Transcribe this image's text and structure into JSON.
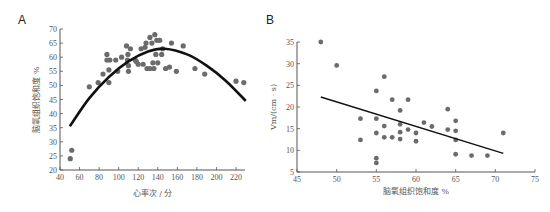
{
  "chart_data": [
    {
      "panel": "A",
      "type": "scatter",
      "title": "",
      "xlabel": "心率次 / 分",
      "ylabel": "脑氧组织饱和度 %",
      "xlim": [
        40,
        230
      ],
      "ylim": [
        20,
        70
      ],
      "xticks": [
        40,
        60,
        80,
        100,
        120,
        140,
        160,
        180,
        200,
        220
      ],
      "yticks": [
        20,
        25,
        30,
        35,
        40,
        45,
        50,
        55,
        60,
        65,
        70
      ],
      "grid": false,
      "points": [
        [
          50.5,
          24
        ],
        [
          52,
          27
        ],
        [
          70,
          49.5
        ],
        [
          79,
          51
        ],
        [
          84,
          54
        ],
        [
          88,
          61
        ],
        [
          88,
          59
        ],
        [
          91,
          59
        ],
        [
          90,
          51
        ],
        [
          90,
          55.5
        ],
        [
          97,
          59
        ],
        [
          99,
          55
        ],
        [
          103,
          60
        ],
        [
          108,
          64
        ],
        [
          109.5,
          61
        ],
        [
          110,
          57
        ],
        [
          110,
          55
        ],
        [
          112,
          63
        ],
        [
          109,
          59
        ],
        [
          117,
          59
        ],
        [
          118,
          58.5
        ],
        [
          120,
          57.5
        ],
        [
          123,
          63
        ],
        [
          125,
          57.5
        ],
        [
          127,
          63.5
        ],
        [
          128,
          65
        ],
        [
          129,
          56
        ],
        [
          132,
          56
        ],
        [
          132,
          67
        ],
        [
          134,
          65
        ],
        [
          135,
          58
        ],
        [
          136,
          56
        ],
        [
          137,
          68
        ],
        [
          138,
          61
        ],
        [
          139,
          66
        ],
        [
          140,
          58
        ],
        [
          142,
          66
        ],
        [
          144,
          61
        ],
        [
          145,
          63
        ],
        [
          148,
          56
        ],
        [
          152,
          56.5
        ],
        [
          154,
          65
        ],
        [
          159,
          55
        ],
        [
          166,
          64
        ],
        [
          178,
          56
        ],
        [
          188,
          54
        ],
        [
          220,
          51.5
        ],
        [
          228,
          51
        ]
      ],
      "fit": {
        "type": "quadratic",
        "x": [
          50,
          70,
          90,
          110,
          130,
          147,
          170,
          190,
          210,
          230
        ],
        "y": [
          35.5,
          45.5,
          53,
          58.5,
          62,
          63,
          61,
          57,
          51.5,
          44.5
        ]
      }
    },
    {
      "panel": "B",
      "type": "scatter",
      "title": "",
      "xlabel": "脑氧组织饱和度 %",
      "ylabel": "Vm/(cm · s)",
      "xlim": [
        45,
        75
      ],
      "ylim": [
        5,
        35
      ],
      "xticks": [
        45,
        50,
        55,
        60,
        65,
        70,
        75
      ],
      "yticks": [
        5,
        10,
        15,
        20,
        25,
        30,
        35
      ],
      "grid": false,
      "points": [
        [
          48,
          35
        ],
        [
          50,
          29.6
        ],
        [
          56,
          27
        ],
        [
          55,
          23.7
        ],
        [
          57,
          21.7
        ],
        [
          59,
          21.7
        ],
        [
          58,
          19.2
        ],
        [
          64,
          19.5
        ],
        [
          53,
          17.3
        ],
        [
          55,
          17.3
        ],
        [
          65,
          16.8
        ],
        [
          61,
          16.4
        ],
        [
          58,
          16
        ],
        [
          56,
          15.6
        ],
        [
          62,
          15.5
        ],
        [
          59,
          14.8
        ],
        [
          64,
          14.8
        ],
        [
          65,
          14.5
        ],
        [
          55,
          14
        ],
        [
          58,
          14.2
        ],
        [
          60,
          14
        ],
        [
          71,
          14
        ],
        [
          56,
          13
        ],
        [
          57,
          13
        ],
        [
          53,
          12.4
        ],
        [
          58,
          12.6
        ],
        [
          60,
          12.1
        ],
        [
          65,
          12.4
        ],
        [
          65,
          9.1
        ],
        [
          67,
          8.8
        ],
        [
          69,
          8.8
        ],
        [
          55,
          8.2
        ],
        [
          55,
          7.1
        ]
      ],
      "fit": {
        "type": "linear",
        "x": [
          48,
          71
        ],
        "y": [
          22.3,
          9.3
        ]
      }
    }
  ],
  "labels": {
    "panel_a": "A",
    "panel_b": "B"
  }
}
